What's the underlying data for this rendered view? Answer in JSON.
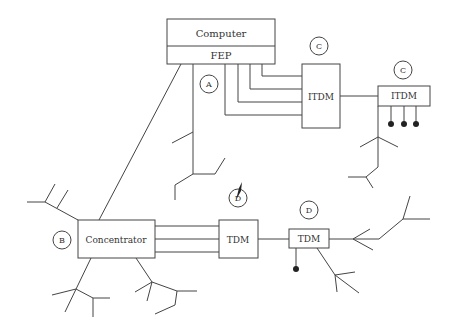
{
  "diagram": {
    "type": "network-topology",
    "nodes": {
      "computer": {
        "label": "Computer"
      },
      "fep": {
        "label": "FEP"
      },
      "itdm_main": {
        "label": "ITDM",
        "marker": "C"
      },
      "itdm_remote": {
        "label": "ITDM",
        "marker": "C"
      },
      "concentrator": {
        "label": "Concentrator",
        "marker": "B"
      },
      "tdm_main": {
        "label": "TDM",
        "marker": "D"
      },
      "tdm_remote": {
        "label": "TDM",
        "marker": "D"
      }
    },
    "markers": {
      "a": "A",
      "b": "B",
      "c1": "C",
      "c2": "C",
      "d1": "D",
      "d2": "D"
    },
    "colors": {
      "line": "#444444",
      "text": "#333333",
      "background": "#ffffff"
    }
  }
}
